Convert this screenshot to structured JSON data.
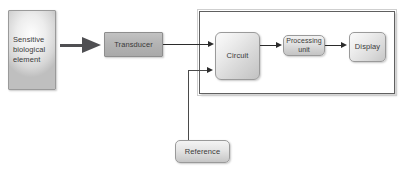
{
  "diagram": {
    "nodes": {
      "sensitive": {
        "label": "Sensitive biological element",
        "text": "Sensitive\nbiological\nelement"
      },
      "transducer": {
        "label": "Transducer"
      },
      "circuit": {
        "label": "Circuit"
      },
      "processing": {
        "label": "Processing unit",
        "line1": "Processing",
        "line2": "unit"
      },
      "display": {
        "label": "Display"
      },
      "reference": {
        "label": "Reference"
      }
    },
    "connectors": [
      {
        "name": "sensitive-to-transducer",
        "from": "sensitive",
        "to": "transducer",
        "style": "thick-arrow"
      },
      {
        "name": "transducer-to-circuit",
        "from": "transducer",
        "to": "circuit",
        "style": "arrow"
      },
      {
        "name": "circuit-to-processing",
        "from": "circuit",
        "to": "processing",
        "style": "arrow"
      },
      {
        "name": "processing-to-display",
        "from": "processing",
        "to": "display",
        "style": "arrow"
      },
      {
        "name": "reference-to-circuit",
        "from": "reference",
        "to": "circuit",
        "style": "elbow-arrow"
      }
    ],
    "groups": [
      {
        "name": "instrument-enclosure",
        "contains": [
          "circuit",
          "processing",
          "display"
        ]
      }
    ],
    "colors": {
      "box_border": "#9a9a9a",
      "box_fill_light": "#ededed",
      "box_fill_dark": "#c2c2c2",
      "transducer_fill": "#b4b4b4",
      "connector": "#2b2b2b",
      "enclosure_border": "#606060",
      "text": "#3a3a3a",
      "background": "#ffffff"
    }
  }
}
